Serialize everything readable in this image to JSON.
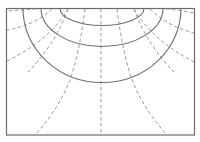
{
  "diagram": {
    "type": "field-lines",
    "colors": {
      "frame": "#6a6a6a",
      "equipotential": "#6e6e6e",
      "field_line": "#8a8a8a",
      "background": "#ffffff"
    },
    "equipotential_arcs": [
      {
        "id": "inner",
        "x_start": 60,
        "x_end": 144,
        "bottom_y": 25
      },
      {
        "id": "middle",
        "x_start": 41,
        "x_end": 163,
        "bottom_y": 46
      },
      {
        "id": "outer",
        "x_start": 23,
        "x_end": 181,
        "bottom_y": 82
      }
    ],
    "field_line_count": 11
  }
}
